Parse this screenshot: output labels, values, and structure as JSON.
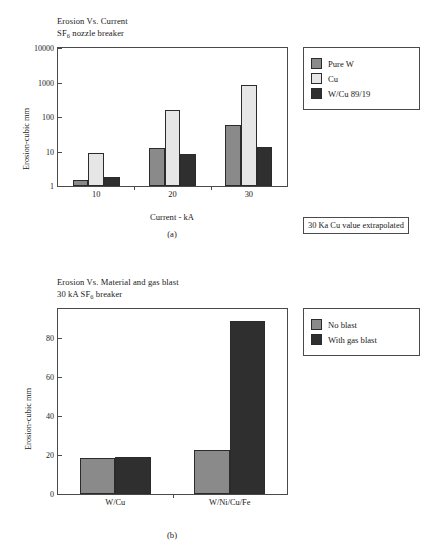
{
  "figure": {
    "panel_a": {
      "title_line1": "Erosion Vs. Current",
      "title_line2_pre": "SF",
      "title_line2_sub": "6",
      "title_line2_post": " nozzle breaker",
      "caption": "(a)",
      "note": "30 Ka Cu value extrapolated",
      "legend": [
        {
          "label": "Pure W",
          "color": "#8a8a8a"
        },
        {
          "label": "Cu",
          "color": "#e6e6e6"
        },
        {
          "label": "W/Cu 89/19",
          "color": "#2f2f2f"
        }
      ]
    },
    "panel_b": {
      "title_line1": "Erosion Vs. Material and gas blast",
      "title_line2_pre": "30 kA SF",
      "title_line2_sub": "6",
      "title_line2_post": " breaker",
      "caption": "(b)",
      "legend": [
        {
          "label": "No blast",
          "color": "#8a8a8a"
        },
        {
          "label": "With gas blast",
          "color": "#2f2f2f"
        }
      ]
    }
  },
  "chart_data": [
    {
      "type": "bar",
      "id": "panel-a",
      "title": "Erosion Vs. Current — SF6 nozzle breaker",
      "xlabel": "Current - kA",
      "ylabel": "Erosion-cubic mm",
      "yscale": "log",
      "ylim": [
        1,
        10000
      ],
      "yticks": [
        1,
        10,
        100,
        1000,
        10000
      ],
      "ytick_labels": [
        "1",
        "10",
        "100",
        "1000",
        "10000"
      ],
      "grid": false,
      "legend_position": "right-outside",
      "categories": [
        "10",
        "20",
        "30"
      ],
      "series": [
        {
          "name": "Pure W",
          "color": "#8a8a8a",
          "values": [
            1.5,
            12.5,
            58
          ]
        },
        {
          "name": "Cu",
          "color": "#e6e6e6",
          "values": [
            8.8,
            165,
            850
          ]
        },
        {
          "name": "W/Cu 89/19",
          "color": "#2f2f2f",
          "values": [
            1.8,
            8.3,
            13.5
          ]
        }
      ],
      "annotations": [
        "30 Ka Cu value extrapolated"
      ]
    },
    {
      "type": "bar",
      "id": "panel-b",
      "title": "Erosion Vs. Material and gas blast — 30 kA SF6 breaker",
      "xlabel": "",
      "ylabel": "Erosion-cubic mm",
      "yscale": "linear",
      "ylim": [
        0,
        95
      ],
      "yticks": [
        0,
        20,
        40,
        60,
        80
      ],
      "ytick_labels": [
        "0",
        "20",
        "40",
        "60",
        "80"
      ],
      "grid": false,
      "legend_position": "right-outside",
      "categories": [
        "W/Cu",
        "W/Ni/Cu/Fe"
      ],
      "series": [
        {
          "name": "No blast",
          "color": "#8a8a8a",
          "values": [
            18.3,
            22.5
          ]
        },
        {
          "name": "With gas blast",
          "color": "#2f2f2f",
          "values": [
            18.8,
            89
          ]
        }
      ],
      "annotations": []
    }
  ]
}
